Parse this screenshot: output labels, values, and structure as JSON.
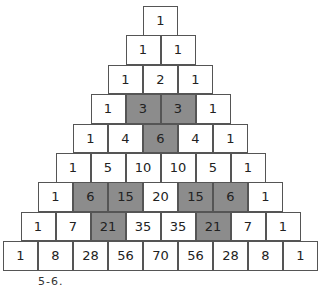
{
  "colors": {
    "highlight": "#8c8c8c",
    "cell": "#ffffff",
    "border": "#555555"
  },
  "rows": [
    [
      {
        "v": "1"
      }
    ],
    [
      {
        "v": "1"
      },
      {
        "v": "1"
      }
    ],
    [
      {
        "v": "1"
      },
      {
        "v": "2"
      },
      {
        "v": "1"
      }
    ],
    [
      {
        "v": "1"
      },
      {
        "v": "3",
        "hl": true
      },
      {
        "v": "3",
        "hl": true
      },
      {
        "v": "1"
      }
    ],
    [
      {
        "v": "1"
      },
      {
        "v": "4"
      },
      {
        "v": "6",
        "hl": true
      },
      {
        "v": "4"
      },
      {
        "v": "1"
      }
    ],
    [
      {
        "v": "1"
      },
      {
        "v": "5"
      },
      {
        "v": "10"
      },
      {
        "v": "10"
      },
      {
        "v": "5"
      },
      {
        "v": "1"
      }
    ],
    [
      {
        "v": "1"
      },
      {
        "v": "6",
        "hl": true
      },
      {
        "v": "15",
        "hl": true
      },
      {
        "v": "20"
      },
      {
        "v": "15",
        "hl": true
      },
      {
        "v": "6",
        "hl": true
      },
      {
        "v": "1"
      }
    ],
    [
      {
        "v": "1"
      },
      {
        "v": "7"
      },
      {
        "v": "21",
        "hl": true
      },
      {
        "v": "35"
      },
      {
        "v": "35"
      },
      {
        "v": "21",
        "hl": true
      },
      {
        "v": "7"
      },
      {
        "v": "1"
      }
    ],
    [
      {
        "v": "1"
      },
      {
        "v": "8"
      },
      {
        "v": "28"
      },
      {
        "v": "56"
      },
      {
        "v": "70"
      },
      {
        "v": "56"
      },
      {
        "v": "28"
      },
      {
        "v": "8"
      },
      {
        "v": "1"
      }
    ]
  ],
  "caption": "5-6."
}
